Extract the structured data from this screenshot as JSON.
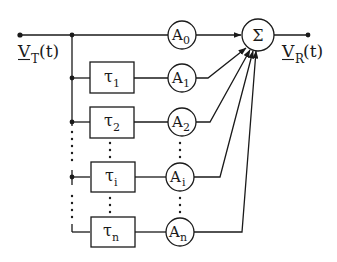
{
  "diagram": {
    "input_label": {
      "main": "V",
      "sub": "T",
      "suffix": "(t)"
    },
    "output_label": {
      "main": "V",
      "sub": "R",
      "suffix": "(t)"
    },
    "summer_symbol": "Σ",
    "delays": [
      {
        "main": "τ",
        "sub": "1"
      },
      {
        "main": "τ",
        "sub": "2"
      },
      {
        "main": "τ",
        "sub": "i"
      },
      {
        "main": "τ",
        "sub": "n"
      }
    ],
    "gains": [
      {
        "main": "A",
        "sub": "0"
      },
      {
        "main": "A",
        "sub": "1"
      },
      {
        "main": "A",
        "sub": "2"
      },
      {
        "main": "A",
        "sub": "i"
      },
      {
        "main": "A",
        "sub": "n"
      }
    ],
    "colors": {
      "stroke": "#1a1a1a",
      "background": "#ffffff"
    }
  }
}
